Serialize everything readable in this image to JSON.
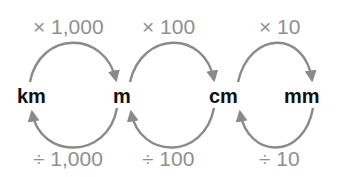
{
  "diagram": {
    "units": [
      {
        "id": "km",
        "label": "km"
      },
      {
        "id": "m",
        "label": "m"
      },
      {
        "id": "cm",
        "label": "cm"
      },
      {
        "id": "mm",
        "label": "mm"
      }
    ],
    "multiply": [
      {
        "from": "km",
        "to": "m",
        "label": "× 1,000"
      },
      {
        "from": "m",
        "to": "cm",
        "label": "× 100"
      },
      {
        "from": "cm",
        "to": "mm",
        "label": "× 10"
      }
    ],
    "divide": [
      {
        "from": "m",
        "to": "km",
        "label": "÷ 1,000"
      },
      {
        "from": "cm",
        "to": "m",
        "label": "÷ 100"
      },
      {
        "from": "mm",
        "to": "cm",
        "label": "÷ 10"
      }
    ],
    "colors": {
      "arrow": "#8a8a8a",
      "op_text": "#8f8f8f",
      "unit_text": "#111111",
      "background": "#ffffff"
    }
  }
}
